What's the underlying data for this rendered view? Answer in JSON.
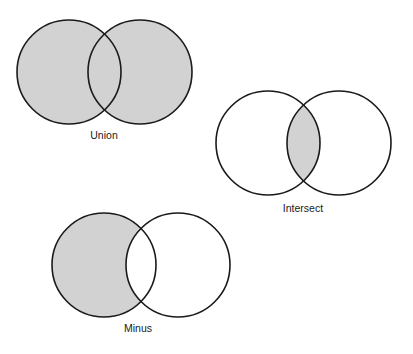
{
  "diagram": {
    "type": "venn-set-operations",
    "colors": {
      "shade": "#d2d2d2",
      "outline": "#1a1a1a",
      "background": "#ffffff"
    },
    "panels": [
      {
        "id": "union",
        "label": "Union",
        "shaded_region": "A ∪ B",
        "circles": [
          {
            "cx": 69,
            "cy": 72,
            "r": 52
          },
          {
            "cx": 140,
            "cy": 72,
            "r": 52
          }
        ],
        "label_pos": {
          "x": 104,
          "y": 139
        }
      },
      {
        "id": "intersect",
        "label": "Intersect",
        "shaded_region": "A ∩ B",
        "circles": [
          {
            "cx": 268,
            "cy": 143,
            "r": 52
          },
          {
            "cx": 339,
            "cy": 143,
            "r": 52
          }
        ],
        "label_pos": {
          "x": 303,
          "y": 212
        }
      },
      {
        "id": "minus",
        "label": "Minus",
        "shaded_region": "A − B",
        "circles": [
          {
            "cx": 104,
            "cy": 265,
            "r": 52
          },
          {
            "cx": 178,
            "cy": 265,
            "r": 52
          }
        ],
        "label_pos": {
          "x": 138,
          "y": 332
        }
      }
    ]
  }
}
